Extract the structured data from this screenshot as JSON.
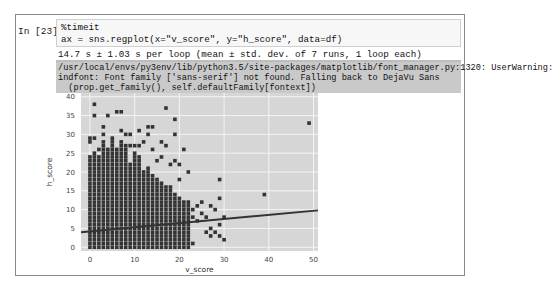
{
  "cell": {
    "prompt": "In [23]:",
    "code_lines": [
      "%timeit",
      "ax = sns.regplot(x=\"v_score\", y=\"h_score\", data=df)"
    ],
    "timing_output": "14.7 s ± 1.03 s per loop (mean ± std. dev. of 7 runs, 1 loop each)",
    "stderr_lines": [
      "/usr/local/envs/py3env/lib/python3.5/site-packages/matplotlib/font_manager.py:1320: UserWarning:",
      "indfont: Font family ['sans-serif'] not found. Falling back to DejaVu Sans",
      "  (prop.get_family(), self.defaultFamily[fontext])"
    ]
  },
  "chart_data": {
    "type": "scatter",
    "title": "",
    "xlabel": "v_score",
    "ylabel": "h_score",
    "xlim": [
      -2,
      51
    ],
    "ylim": [
      -1,
      41
    ],
    "x_ticks": [
      "0",
      "10",
      "20",
      "30",
      "40",
      "50"
    ],
    "y_ticks": [
      "0",
      "5",
      "10",
      "15",
      "20",
      "25",
      "30",
      "35",
      "40"
    ],
    "grid": true,
    "background": "#d6d6d6",
    "point_color": "#333333",
    "dense_columns": [
      {
        "x": 0,
        "ymax": 24
      },
      {
        "x": 1,
        "ymax": 25
      },
      {
        "x": 2,
        "ymax": 24
      },
      {
        "x": 3,
        "ymax": 28
      },
      {
        "x": 4,
        "ymax": 26
      },
      {
        "x": 5,
        "ymax": 28
      },
      {
        "x": 6,
        "ymax": 26
      },
      {
        "x": 7,
        "ymax": 28
      },
      {
        "x": 8,
        "ymax": 27
      },
      {
        "x": 9,
        "ymax": 22
      },
      {
        "x": 10,
        "ymax": 24
      },
      {
        "x": 11,
        "ymax": 24
      },
      {
        "x": 12,
        "ymax": 20
      },
      {
        "x": 13,
        "ymax": 21
      },
      {
        "x": 14,
        "ymax": 19
      },
      {
        "x": 15,
        "ymax": 18
      },
      {
        "x": 16,
        "ymax": 17
      },
      {
        "x": 17,
        "ymax": 16
      },
      {
        "x": 18,
        "ymax": 16
      },
      {
        "x": 19,
        "ymax": 14
      },
      {
        "x": 20,
        "ymax": 13
      },
      {
        "x": 21,
        "ymax": 12
      },
      {
        "x": 22,
        "ymax": 12
      }
    ],
    "outliers": [
      {
        "x": 0,
        "y": 29
      },
      {
        "x": 0,
        "y": 28
      },
      {
        "x": 1,
        "y": 38
      },
      {
        "x": 1,
        "y": 35
      },
      {
        "x": 1,
        "y": 29
      },
      {
        "x": 2,
        "y": 26
      },
      {
        "x": 3,
        "y": 32
      },
      {
        "x": 3,
        "y": 30
      },
      {
        "x": 4,
        "y": 35
      },
      {
        "x": 5,
        "y": 29
      },
      {
        "x": 6,
        "y": 36
      },
      {
        "x": 7,
        "y": 36
      },
      {
        "x": 7,
        "y": 31
      },
      {
        "x": 8,
        "y": 30
      },
      {
        "x": 9,
        "y": 30
      },
      {
        "x": 9,
        "y": 27
      },
      {
        "x": 10,
        "y": 27
      },
      {
        "x": 10,
        "y": 25
      },
      {
        "x": 11,
        "y": 31
      },
      {
        "x": 11,
        "y": 27
      },
      {
        "x": 12,
        "y": 28
      },
      {
        "x": 13,
        "y": 32
      },
      {
        "x": 13,
        "y": 30
      },
      {
        "x": 14,
        "y": 32
      },
      {
        "x": 14,
        "y": 26
      },
      {
        "x": 15,
        "y": 23
      },
      {
        "x": 16,
        "y": 24
      },
      {
        "x": 16,
        "y": 28
      },
      {
        "x": 17,
        "y": 37
      },
      {
        "x": 17,
        "y": 27
      },
      {
        "x": 18,
        "y": 22
      },
      {
        "x": 19,
        "y": 34
      },
      {
        "x": 19,
        "y": 30
      },
      {
        "x": 19,
        "y": 23
      },
      {
        "x": 20,
        "y": 18
      },
      {
        "x": 20,
        "y": 22
      },
      {
        "x": 21,
        "y": 26
      },
      {
        "x": 22,
        "y": 20
      },
      {
        "x": 23,
        "y": 10
      },
      {
        "x": 23,
        "y": 8
      },
      {
        "x": 23,
        "y": 1
      },
      {
        "x": 24,
        "y": 7
      },
      {
        "x": 24,
        "y": 11
      },
      {
        "x": 25,
        "y": 9
      },
      {
        "x": 25,
        "y": 12
      },
      {
        "x": 26,
        "y": 4
      },
      {
        "x": 26,
        "y": 8
      },
      {
        "x": 27,
        "y": 5
      },
      {
        "x": 27,
        "y": 3
      },
      {
        "x": 28,
        "y": 10
      },
      {
        "x": 28,
        "y": 4
      },
      {
        "x": 29,
        "y": 13
      },
      {
        "x": 29,
        "y": 6
      },
      {
        "x": 30,
        "y": 8
      },
      {
        "x": 30,
        "y": 2
      },
      {
        "x": 29,
        "y": 18
      },
      {
        "x": 27,
        "y": 11
      },
      {
        "x": 29,
        "y": 3
      },
      {
        "x": 39,
        "y": 14
      },
      {
        "x": 49,
        "y": 33
      }
    ],
    "regression": {
      "x0": -2,
      "y0": 4.0,
      "x1": 51,
      "y1": 9.8
    }
  }
}
